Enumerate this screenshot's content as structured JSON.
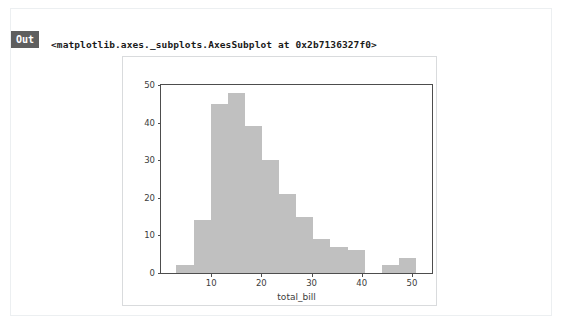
{
  "cell": {
    "prompt_label": "Out",
    "repr_text": "<matplotlib.axes._subplots.AxesSubplot at 0x2b7136327f0>"
  },
  "colors": {
    "bar_fill": "#c0c0c0",
    "axis_line": "#4d4d4d",
    "tick_text": "#3c3c3c",
    "prompt_badge_bg": "#5e5e5e",
    "prompt_badge_text": "#ffffff",
    "figure_border": "#d9dbdd",
    "card_border": "#eceff1",
    "page_bg": "#ffffff"
  },
  "chart_data": {
    "type": "bar",
    "chart_subtype": "histogram",
    "title": "",
    "xlabel": "total_bill",
    "ylabel": "",
    "xlim": [
      0.0,
      54.0
    ],
    "ylim": [
      0,
      50
    ],
    "grid": false,
    "legend": false,
    "legend_position": "none",
    "xticks": [
      10,
      20,
      30,
      40,
      50
    ],
    "xtick_labels": [
      "10",
      "20",
      "30",
      "40",
      "50"
    ],
    "yticks": [
      0,
      10,
      20,
      30,
      40,
      50
    ],
    "ytick_labels": [
      "0",
      "10",
      "20",
      "30",
      "40",
      "50"
    ],
    "bin_count": 14,
    "bin_edges": [
      3.07,
      6.48,
      9.89,
      13.3,
      16.71,
      20.12,
      23.53,
      26.95,
      30.36,
      33.77,
      37.18,
      40.59,
      44.0,
      47.41,
      50.81
    ],
    "bin_width": 3.41,
    "values": [
      2,
      14,
      45,
      48,
      39,
      30,
      21,
      15,
      9,
      7,
      6,
      0,
      2,
      4
    ],
    "bin_centers": [
      4.78,
      8.19,
      11.6,
      15.01,
      18.42,
      21.83,
      25.24,
      28.65,
      32.06,
      35.47,
      38.88,
      42.3,
      45.71,
      49.11
    ],
    "series": [
      {
        "name": "total_bill",
        "values": [
          2,
          14,
          45,
          48,
          39,
          30,
          21,
          15,
          9,
          7,
          6,
          0,
          2,
          4
        ]
      }
    ],
    "annotations": []
  }
}
